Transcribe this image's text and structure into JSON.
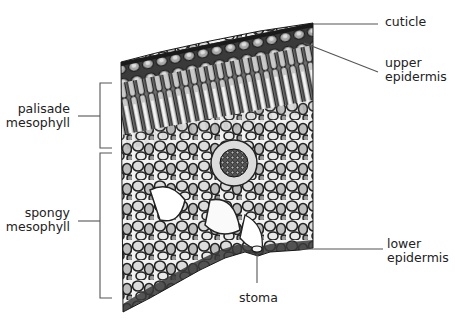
{
  "diagram": {
    "colors": {
      "background": "#ffffff",
      "line": "#555555",
      "text": "#222222",
      "tissue_dark": "#2b2b2b",
      "tissue_mid": "#8a8a8a",
      "tissue_light": "#e8e8e8"
    },
    "labels": {
      "cuticle": {
        "lines": [
          "cuticle"
        ]
      },
      "upper_epidermis": {
        "lines": [
          "upper",
          "epidermis"
        ]
      },
      "palisade_mesophyll": {
        "lines": [
          "palisade",
          "mesophyll"
        ]
      },
      "spongy_mesophyll": {
        "lines": [
          "spongy",
          "mesophyll"
        ]
      },
      "lower_epidermis": {
        "lines": [
          "lower",
          "epidermis"
        ]
      },
      "stoma": {
        "lines": [
          "stoma"
        ]
      }
    }
  }
}
